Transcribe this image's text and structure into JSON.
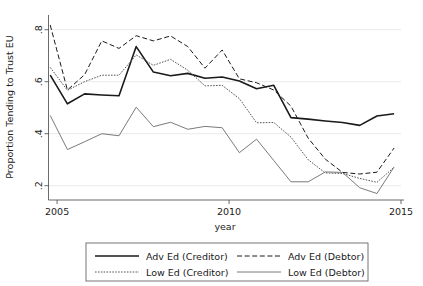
{
  "chart_data": {
    "type": "line",
    "title": "",
    "xlabel": "year",
    "ylabel": "Proportion Tending to Trust EU",
    "xlim": [
      2004.75,
      2015.0
    ],
    "ylim": [
      0.145,
      0.845
    ],
    "grid": true,
    "legend_position": "below",
    "xticks": [
      2005,
      2010,
      2015
    ],
    "xtick_labels": [
      "2005",
      "2010",
      "2015"
    ],
    "yticks": [
      0.2,
      0.4,
      0.6,
      0.8
    ],
    "ytick_labels": [
      ".2",
      ".4",
      ".6",
      ".8"
    ],
    "x": [
      2004.8,
      2005.3,
      2005.8,
      2006.3,
      2006.8,
      2007.3,
      2007.8,
      2008.3,
      2008.8,
      2009.3,
      2009.8,
      2010.3,
      2010.8,
      2011.3,
      2011.8,
      2012.3,
      2012.8,
      2013.3,
      2013.8,
      2014.3,
      2014.8
    ],
    "series": [
      {
        "name": "Adv Ed (Creditor)",
        "style": "solid",
        "color": "#1a1a1a",
        "width": 1.6,
        "values": [
          0.625,
          0.515,
          0.553,
          0.549,
          0.546,
          0.735,
          0.637,
          0.623,
          0.632,
          0.613,
          0.618,
          0.603,
          0.573,
          0.586,
          0.462,
          0.456,
          0.449,
          0.443,
          0.432,
          0.468,
          0.477
        ]
      },
      {
        "name": "Adv Ed (Debtor)",
        "style": "dashed",
        "color": "#1a1a1a",
        "width": 1.0,
        "values": [
          0.818,
          0.568,
          0.627,
          0.757,
          0.728,
          0.777,
          0.757,
          0.776,
          0.735,
          0.652,
          0.722,
          0.611,
          0.596,
          0.568,
          0.506,
          0.383,
          0.302,
          0.251,
          0.245,
          0.252,
          0.345
        ]
      },
      {
        "name": "Low Ed (Creditor)",
        "style": "dotted",
        "color": "#555555",
        "width": 1.0,
        "values": [
          0.655,
          0.567,
          0.6,
          0.625,
          0.625,
          0.703,
          0.663,
          0.686,
          0.644,
          0.584,
          0.586,
          0.535,
          0.442,
          0.443,
          0.387,
          0.3,
          0.249,
          0.247,
          0.228,
          0.213,
          0.271
        ]
      },
      {
        "name": "Low Ed (Debtor)",
        "style": "thin-solid",
        "color": "#6b6b6b",
        "width": 0.9,
        "values": [
          0.47,
          0.339,
          0.369,
          0.4,
          0.392,
          0.502,
          0.427,
          0.444,
          0.417,
          0.428,
          0.423,
          0.327,
          0.379,
          0.297,
          0.215,
          0.215,
          0.253,
          0.251,
          0.192,
          0.17,
          0.272
        ]
      }
    ]
  },
  "legend": {
    "entries": [
      {
        "label": "Adv Ed (Creditor)",
        "style": "solid"
      },
      {
        "label": "Adv Ed (Debtor)",
        "style": "dashed"
      },
      {
        "label": "Low Ed (Creditor)",
        "style": "dotted"
      },
      {
        "label": "Low Ed (Debtor)",
        "style": "thin-solid"
      }
    ]
  }
}
